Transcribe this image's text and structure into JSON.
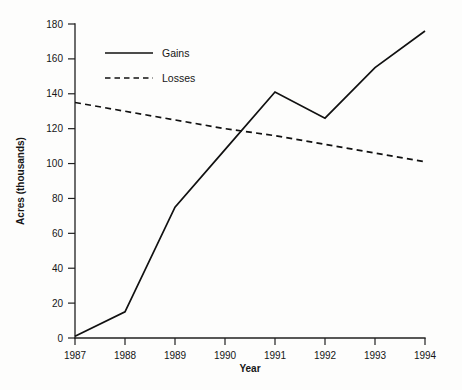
{
  "chart_data": {
    "type": "line",
    "title": "",
    "xlabel": "Year",
    "ylabel": "Acres (thousands)",
    "x": [
      1987,
      1988,
      1989,
      1990,
      1991,
      1992,
      1993,
      1994
    ],
    "xtick_labels": [
      "1987",
      "1988",
      "1989",
      "1990",
      "1991",
      "1992",
      "1993",
      "1994"
    ],
    "ytick_labels": [
      "0",
      "20",
      "40",
      "60",
      "80",
      "100",
      "120",
      "140",
      "160",
      "180"
    ],
    "ytick_values": [
      0,
      20,
      40,
      60,
      80,
      100,
      120,
      140,
      160,
      180
    ],
    "ylim": [
      0,
      180
    ],
    "xlim": [
      1987,
      1994
    ],
    "grid": false,
    "legend_position": "top-left-inside",
    "series": [
      {
        "name": "Gains",
        "style": "solid",
        "color": "#111111",
        "values": [
          1,
          15,
          75,
          108,
          141,
          126,
          155,
          176
        ]
      },
      {
        "name": "Losses",
        "style": "dashed",
        "color": "#111111",
        "values": [
          135,
          130,
          125,
          120,
          116,
          111,
          106,
          101
        ]
      }
    ]
  },
  "legend": {
    "items": [
      {
        "label": "Gains",
        "style": "solid"
      },
      {
        "label": "Losses",
        "style": "dashed"
      }
    ]
  },
  "axes": {
    "x_title": "Year",
    "y_title": "Acres (thousands)"
  }
}
